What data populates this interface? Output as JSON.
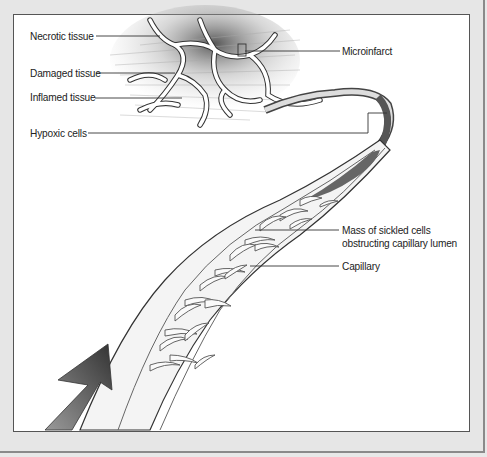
{
  "figure": {
    "colors": {
      "frame": "#e6e6e6",
      "panel": "#ffffff",
      "line": "#333333",
      "arrow": "#555555"
    }
  },
  "labels": {
    "necrotic": "Necrotic tissue",
    "damaged": "Damaged tissue",
    "inflamed": "Inflamed tissue",
    "hypoxic": "Hypoxic cells",
    "microinfarct": "Microinfarct",
    "mass_line1": "Mass of sickled cells",
    "mass_line2": "obstructing capillary lumen",
    "capillary": "Capillary"
  }
}
